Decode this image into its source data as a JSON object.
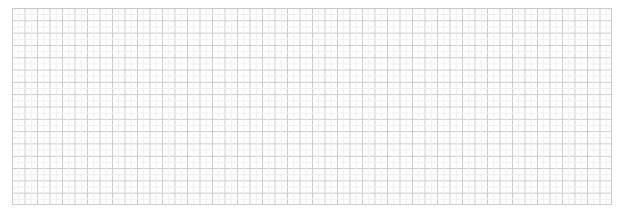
{
  "canvas": {
    "width": 630,
    "height": 216,
    "background_color": "#ffffff"
  },
  "grid": {
    "name": "graph-paper-grid",
    "x": 12,
    "y": 8,
    "width": 600,
    "height": 197,
    "columns": 48,
    "rows": 16,
    "cell_width": 12.5,
    "cell_height": 12.3125,
    "major_line_color": "#c8c8cc",
    "minor_line_color": "#eeeef0",
    "border_color": "#c8c8cc",
    "line_width": 1,
    "subdivision": 2,
    "opacity": 0.95
  },
  "content": {
    "text": "",
    "labels": [],
    "annotations": []
  }
}
